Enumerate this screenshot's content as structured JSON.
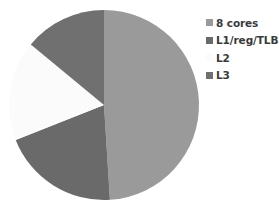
{
  "chart_data": {
    "type": "pie",
    "title": "",
    "categories": [
      "8 cores",
      "L1/reg/TLB",
      "L2",
      "L3"
    ],
    "values": [
      49,
      20,
      17,
      14
    ],
    "unit": "% of chart area (estimated)",
    "colors": [
      "#9a9a9a",
      "#6a6a6a",
      "#fbfbfb",
      "#707070"
    ],
    "start_angle_deg": 0,
    "direction": "clockwise",
    "legend": {
      "position": "right",
      "entries": [
        "8 cores",
        "L1/reg/TLB",
        "L2",
        "L3"
      ]
    }
  },
  "legend": {
    "items": [
      {
        "label": "8 cores",
        "color": "#9a9a9a"
      },
      {
        "label": "L1/reg/TLB",
        "color": "#6a6a6a"
      },
      {
        "label": "L2",
        "color": "#fbfbfb"
      },
      {
        "label": "L3",
        "color": "#707070"
      }
    ]
  }
}
